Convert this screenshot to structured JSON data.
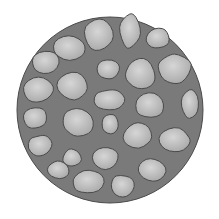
{
  "illustration": {
    "subject": "cluster of rounded stones forming a circular mass",
    "colors": {
      "background": "#ffffff",
      "mortar": "#7a7a7a",
      "mortar_dark": "#6a6a6a",
      "stone_fill": "#b4b4b4",
      "stone_light": "#d2d2d2",
      "outline": "#4a4a4a"
    },
    "stones": [
      {
        "cx": 99,
        "cy": 34,
        "rx": 16,
        "ry": 18
      },
      {
        "cx": 130,
        "cy": 31,
        "rx": 12,
        "ry": 18
      },
      {
        "cx": 158,
        "cy": 38,
        "rx": 13,
        "ry": 11
      },
      {
        "cx": 70,
        "cy": 48,
        "rx": 18,
        "ry": 14
      },
      {
        "cx": 45,
        "cy": 62,
        "rx": 15,
        "ry": 12
      },
      {
        "cx": 175,
        "cy": 68,
        "rx": 18,
        "ry": 16
      },
      {
        "cx": 140,
        "cy": 74,
        "rx": 16,
        "ry": 18
      },
      {
        "cx": 108,
        "cy": 70,
        "rx": 13,
        "ry": 11
      },
      {
        "cx": 72,
        "cy": 86,
        "rx": 17,
        "ry": 15
      },
      {
        "cx": 38,
        "cy": 90,
        "rx": 16,
        "ry": 13
      },
      {
        "cx": 110,
        "cy": 100,
        "rx": 18,
        "ry": 11
      },
      {
        "cx": 150,
        "cy": 106,
        "rx": 16,
        "ry": 14
      },
      {
        "cx": 190,
        "cy": 104,
        "rx": 10,
        "ry": 16
      },
      {
        "cx": 35,
        "cy": 118,
        "rx": 14,
        "ry": 12
      },
      {
        "cx": 78,
        "cy": 122,
        "rx": 16,
        "ry": 16
      },
      {
        "cx": 110,
        "cy": 124,
        "rx": 9,
        "ry": 11
      },
      {
        "cx": 138,
        "cy": 135,
        "rx": 16,
        "ry": 14
      },
      {
        "cx": 174,
        "cy": 140,
        "rx": 17,
        "ry": 14
      },
      {
        "cx": 40,
        "cy": 146,
        "rx": 13,
        "ry": 12
      },
      {
        "cx": 72,
        "cy": 158,
        "rx": 10,
        "ry": 10
      },
      {
        "cx": 105,
        "cy": 158,
        "rx": 15,
        "ry": 12
      },
      {
        "cx": 152,
        "cy": 170,
        "rx": 16,
        "ry": 12
      },
      {
        "cx": 58,
        "cy": 170,
        "rx": 12,
        "ry": 10
      },
      {
        "cx": 88,
        "cy": 182,
        "rx": 17,
        "ry": 13
      },
      {
        "cx": 122,
        "cy": 186,
        "rx": 13,
        "ry": 12
      }
    ]
  }
}
